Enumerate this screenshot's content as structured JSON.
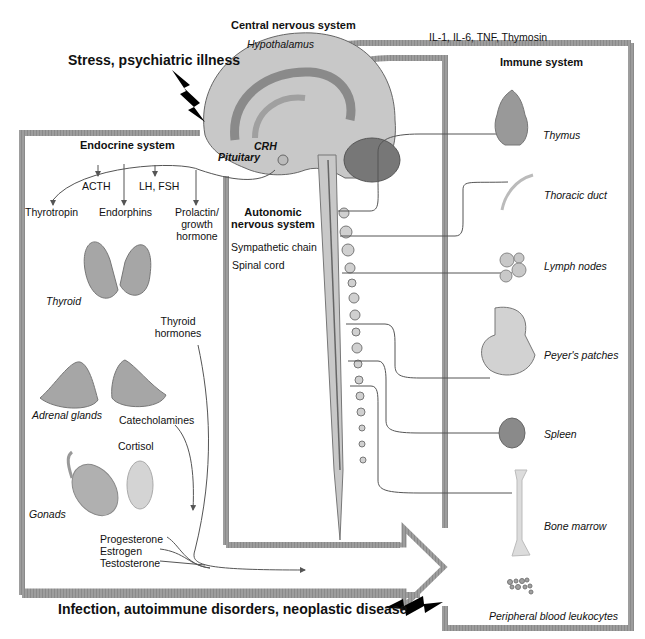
{
  "headings": {
    "stress": "Stress, psychiatric illness",
    "cns": "Central nervous system",
    "cytokines": "IL-1, IL-6, TNF, Thymosin",
    "immune": "Immune system",
    "endocrine": "Endocrine system",
    "ans_line1": "Autonomic",
    "ans_line2": "nervous system",
    "infection": "Infection, autoimmune disorders, neoplastic disease"
  },
  "brain": {
    "hypothalamus": "Hypothalamus",
    "crh": "CRH",
    "pituitary": "Pituitary"
  },
  "pituitary_hormones": {
    "acth": "ACTH",
    "lhfsh": "LH, FSH",
    "thyrotropin": "Thyrotropin",
    "endorphins": "Endorphins",
    "prolactin_l1": "Prolactin/",
    "prolactin_l2": "growth",
    "prolactin_l3": "hormone"
  },
  "endocrine_organs": {
    "thyroid": "Thyroid",
    "thyroid_hormones_l1": "Thyroid",
    "thyroid_hormones_l2": "hormones",
    "adrenal": "Adrenal glands",
    "catecholamines": "Catecholamines",
    "cortisol": "Cortisol",
    "gonads": "Gonads",
    "progesterone": "Progesterone",
    "estrogen": "Estrogen",
    "testosterone": "Testosterone"
  },
  "nervous": {
    "sympathetic_chain": "Sympathetic chain",
    "spinal_cord": "Spinal cord"
  },
  "immune_organs": [
    {
      "label": "Thymus"
    },
    {
      "label": "Thoracic duct"
    },
    {
      "label": "Lymph nodes"
    },
    {
      "label": "Peyer's patches"
    },
    {
      "label": "Spleen"
    },
    {
      "label": "Bone marrow"
    },
    {
      "label": "Peripheral blood leukocytes"
    }
  ],
  "colors": {
    "frame": "#7a7a7a",
    "organ_fill": "#a9a9a9",
    "organ_light": "#d6d6d6",
    "line": "#555555"
  }
}
